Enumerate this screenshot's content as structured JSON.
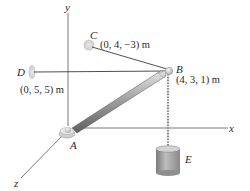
{
  "diagram": {
    "title": "",
    "axes": {
      "x_label": "x",
      "y_label": "y",
      "z_label": "z"
    },
    "points": {
      "A": {
        "label": "A"
      },
      "B": {
        "label": "B",
        "coord": "(4, 3, 1) m"
      },
      "C": {
        "label": "C",
        "coord": "(0, 4, −3) m"
      },
      "D": {
        "label": "D",
        "coord": "(0, 5, 5) m"
      },
      "E": {
        "label": "E"
      }
    },
    "colors": {
      "axis": "#6b6b6b",
      "cable": "#3a3a3a",
      "boom": "#9a9a9a",
      "support": "#d6d6d6",
      "weight": "#a8a8a8"
    }
  }
}
